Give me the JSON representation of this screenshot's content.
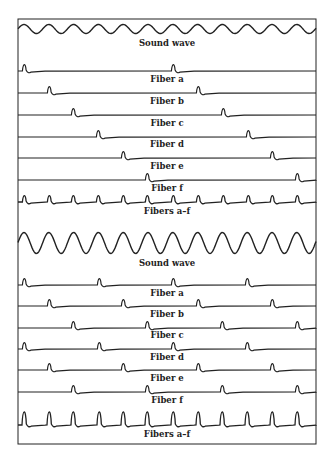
{
  "figure": {
    "frame": {
      "x": 18,
      "y": 19,
      "width": 298,
      "height": 425
    },
    "stroke_color": "#222222",
    "panels": [
      {
        "id": "low-frequency",
        "sound_wave": {
          "label": "Sound wave",
          "baseline_y": 29,
          "amplitude": 4.5,
          "period": 24.8,
          "label_y": 46
        },
        "fibers": [
          {
            "label": "Fiber a",
            "baseline_y": 71,
            "spikes": [
              25,
              174
            ],
            "label_y": 82
          },
          {
            "label": "Fiber b",
            "baseline_y": 93,
            "spikes": [
              50,
              199
            ],
            "label_y": 104
          },
          {
            "label": "Fiber c",
            "baseline_y": 115,
            "spikes": [
              74,
              224
            ],
            "label_y": 126
          },
          {
            "label": "Fiber d",
            "baseline_y": 137,
            "spikes": [
              99,
              249
            ],
            "label_y": 147
          },
          {
            "label": "Fiber e",
            "baseline_y": 158,
            "spikes": [
              124,
              273
            ],
            "label_y": 169
          },
          {
            "label": "Fiber f",
            "baseline_y": 180,
            "spikes": [
              148,
              298
            ],
            "label_y": 191
          }
        ],
        "combined": {
          "label": "Fibers a–f",
          "baseline_y": 202,
          "spike_height": 8,
          "spikes": [
            25,
            50,
            74,
            99,
            124,
            148,
            174,
            199,
            224,
            249,
            273,
            298
          ],
          "label_y": 214
        }
      },
      {
        "id": "high-frequency",
        "sound_wave": {
          "label": "Sound wave",
          "baseline_y": 243,
          "amplitude": 10.5,
          "period": 24.8,
          "label_y": 266
        },
        "fibers": [
          {
            "label": "Fiber a",
            "baseline_y": 285,
            "spikes": [
              25,
              100,
              174,
              248
            ],
            "label_y": 296
          },
          {
            "label": "Fiber b",
            "baseline_y": 306,
            "spikes": [
              50,
              124,
              199,
              273
            ],
            "label_y": 317
          },
          {
            "label": "Fiber c",
            "baseline_y": 328,
            "spikes": [
              74,
              148,
              223,
              298
            ],
            "label_y": 338
          },
          {
            "label": "Fiber d",
            "baseline_y": 349,
            "spikes": [
              25,
              100,
              174,
              248
            ],
            "label_y": 360
          },
          {
            "label": "Fiber e",
            "baseline_y": 370,
            "spikes": [
              50,
              124,
              199,
              273
            ],
            "label_y": 381
          },
          {
            "label": "Fiber f",
            "baseline_y": 392,
            "spikes": [
              74,
              148,
              223,
              298
            ],
            "label_y": 403
          }
        ],
        "combined": {
          "label": "Fibers a–f",
          "baseline_y": 425,
          "spike_height": 17,
          "spikes": [
            25,
            50,
            74,
            100,
            124,
            148,
            174,
            199,
            223,
            248,
            273,
            298
          ],
          "label_y": 437
        }
      }
    ]
  }
}
